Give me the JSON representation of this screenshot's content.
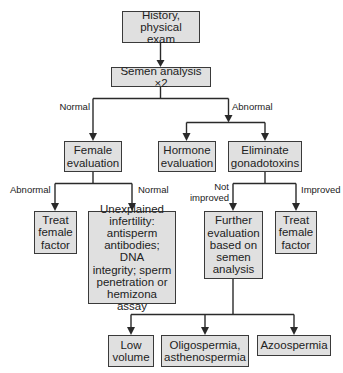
{
  "diagram": {
    "type": "flowchart",
    "colors": {
      "box_fill": "#e0e0e0",
      "box_border": "#3a3a3a",
      "line": "#2a2a2a",
      "text": "#222222"
    },
    "nodes": {
      "history": "History,\nphysical exam",
      "semen": "Semen analysis ×2",
      "female_eval": "Female\nevaluation",
      "hormone_eval": "Hormone\nevaluation",
      "eliminate": "Eliminate\ngonadotoxins",
      "treat_female_1": "Treat\nfemale\nfactor",
      "unexplained": "Unexplained\ninfertility:\nantisperm\nantibodies; DNA\nintegrity; sperm\npenetration or\nhemizona assay",
      "further_eval": "Further\nevaluation\nbased on\nsemen\nanalysis",
      "treat_female_2": "Treat\nfemale\nfactor",
      "low_volume": "Low\nvolume",
      "oligo": "Oligospermia,\nasthenospermia",
      "azoo": "Azoospermia"
    },
    "edge_labels": {
      "semen_normal": "Normal",
      "semen_abnormal": "Abnormal",
      "female_abnormal": "Abnormal",
      "female_normal": "Normal",
      "eliminate_not_improved": "Not\nimproved",
      "eliminate_improved": "Improved"
    },
    "edges": [
      {
        "from": "history",
        "to": "semen"
      },
      {
        "from": "semen",
        "to": "female_eval",
        "label": "Normal"
      },
      {
        "from": "semen",
        "to": "hormone_eval",
        "label": "Abnormal"
      },
      {
        "from": "semen",
        "to": "eliminate",
        "label": "Abnormal"
      },
      {
        "from": "female_eval",
        "to": "treat_female_1",
        "label": "Abnormal"
      },
      {
        "from": "female_eval",
        "to": "unexplained",
        "label": "Normal"
      },
      {
        "from": "eliminate",
        "to": "further_eval",
        "label": "Not improved"
      },
      {
        "from": "eliminate",
        "to": "treat_female_2",
        "label": "Improved"
      },
      {
        "from": "further_eval",
        "to": "low_volume"
      },
      {
        "from": "further_eval",
        "to": "oligo"
      },
      {
        "from": "further_eval",
        "to": "azoo"
      }
    ]
  }
}
